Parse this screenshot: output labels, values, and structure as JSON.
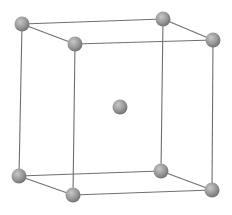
{
  "diagram": {
    "type": "crystal-lattice",
    "structure": "body-centered-cubic",
    "colors": {
      "background": "#ffffff",
      "edge": "#6f6f6f",
      "atom_light": "#c8c8c8",
      "atom_mid": "#9a9a9a",
      "atom_dark": "#6e6e6e"
    },
    "atom_radius": 7.5,
    "atoms": [
      {
        "id": "top-back-left",
        "x": 22,
        "y": 24
      },
      {
        "id": "top-back-right",
        "x": 163,
        "y": 19
      },
      {
        "id": "top-front-left",
        "x": 75,
        "y": 44
      },
      {
        "id": "top-front-right",
        "x": 213,
        "y": 40
      },
      {
        "id": "center",
        "x": 120,
        "y": 107
      },
      {
        "id": "bottom-back-left",
        "x": 19,
        "y": 176
      },
      {
        "id": "bottom-back-right",
        "x": 161,
        "y": 171
      },
      {
        "id": "bottom-front-left",
        "x": 73,
        "y": 195
      },
      {
        "id": "bottom-front-right",
        "x": 212,
        "y": 190
      }
    ],
    "edges": [
      [
        "top-back-left",
        "top-back-right"
      ],
      [
        "top-back-left",
        "top-front-left"
      ],
      [
        "top-back-right",
        "top-front-right"
      ],
      [
        "top-front-left",
        "top-front-right"
      ],
      [
        "bottom-back-left",
        "bottom-back-right"
      ],
      [
        "bottom-back-left",
        "bottom-front-left"
      ],
      [
        "bottom-back-right",
        "bottom-front-right"
      ],
      [
        "bottom-front-left",
        "bottom-front-right"
      ],
      [
        "top-back-left",
        "bottom-back-left"
      ],
      [
        "top-back-right",
        "bottom-back-right"
      ],
      [
        "top-front-left",
        "bottom-front-left"
      ],
      [
        "top-front-right",
        "bottom-front-right"
      ]
    ]
  }
}
